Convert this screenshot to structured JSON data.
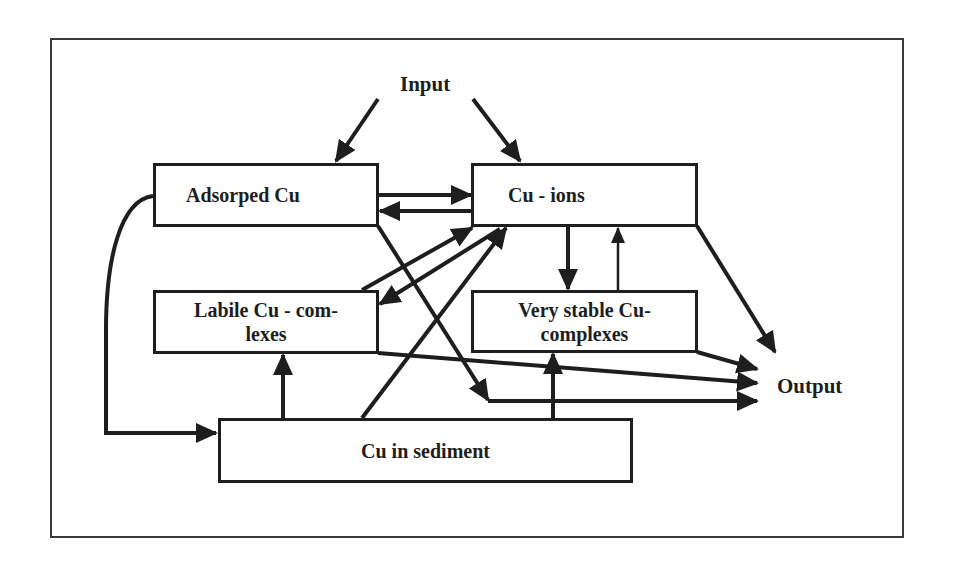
{
  "diagram": {
    "labels": {
      "input": "Input",
      "output": "Output"
    },
    "nodes": {
      "adsorped": {
        "label": "Adsorped Cu"
      },
      "ions": {
        "label": "Cu - ions"
      },
      "labile": {
        "line1": "Labile Cu - com-",
        "line2": "lexes"
      },
      "stable": {
        "line1": "Very stable Cu-",
        "line2": "complexes"
      },
      "sediment": {
        "label": "Cu in sediment"
      }
    },
    "edges": [
      {
        "from": "Input",
        "to": "Adsorped Cu"
      },
      {
        "from": "Input",
        "to": "Cu - ions"
      },
      {
        "from": "Adsorped Cu",
        "to": "Cu - ions"
      },
      {
        "from": "Cu - ions",
        "to": "Adsorped Cu"
      },
      {
        "from": "Adsorped Cu",
        "to": "Cu in sediment"
      },
      {
        "from": "Adsorped Cu",
        "to": "Output"
      },
      {
        "from": "Labile Cu-complexes",
        "to": "Cu - ions"
      },
      {
        "from": "Cu - ions",
        "to": "Labile Cu-complexes"
      },
      {
        "from": "Cu in sediment",
        "to": "Cu - ions"
      },
      {
        "from": "Cu - ions",
        "to": "Very stable Cu-complexes"
      },
      {
        "from": "Very stable Cu-complexes",
        "to": "Cu - ions"
      },
      {
        "from": "Cu - ions",
        "to": "Output"
      },
      {
        "from": "Labile Cu-complexes",
        "to": "Output"
      },
      {
        "from": "Very stable Cu-complexes",
        "to": "Output"
      },
      {
        "from": "Cu in sediment",
        "to": "Labile Cu-complexes"
      },
      {
        "from": "Cu in sediment",
        "to": "Very stable Cu-complexes"
      }
    ],
    "colors": {
      "ink": "#1e1e1e",
      "frame": "#3a3a3a",
      "background": "#ffffff"
    }
  }
}
